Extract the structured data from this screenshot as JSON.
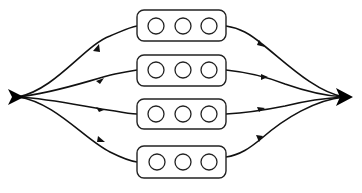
{
  "diagram": {
    "type": "parallel-branch flow diagram",
    "colors": {
      "stroke": "#111111",
      "fill": "#ffffff",
      "terminal": "#000000"
    },
    "source": {
      "name": "source",
      "x": 14,
      "y": 97,
      "shape": "arrowhead"
    },
    "sink": {
      "name": "sink",
      "x": 350,
      "y": 97,
      "shape": "arrowhead"
    },
    "branches": [
      {
        "id": 1,
        "box": {
          "x": 137,
          "y": 10,
          "w": 89,
          "h": 31
        },
        "circles": 3
      },
      {
        "id": 2,
        "box": {
          "x": 137,
          "y": 55,
          "w": 89,
          "h": 31
        },
        "circles": 3
      },
      {
        "id": 3,
        "box": {
          "x": 137,
          "y": 99,
          "w": 89,
          "h": 30
        },
        "circles": 3
      },
      {
        "id": 4,
        "box": {
          "x": 137,
          "y": 146,
          "w": 89,
          "h": 32
        },
        "circles": 3
      }
    ],
    "box_count": 4,
    "circles_per_box": 3
  }
}
